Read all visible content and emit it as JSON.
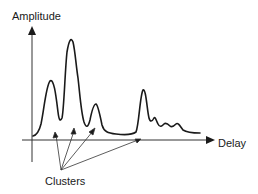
{
  "diagram": {
    "y_axis_label": "Amplitude",
    "x_axis_label": "Delay",
    "annotation_label": "Clusters",
    "colors": {
      "stroke": "#1a1a1a",
      "axis": "#333333",
      "background": "#ffffff"
    },
    "waveform_description": "Power delay profile with clustered multipath peaks",
    "peaks": [
      {
        "index": 1,
        "relative_height": "medium"
      },
      {
        "index": 2,
        "relative_height": "highest"
      },
      {
        "index": 3,
        "relative_height": "low"
      },
      {
        "index": 4,
        "relative_height": "medium"
      }
    ],
    "arrow_count": 4
  }
}
